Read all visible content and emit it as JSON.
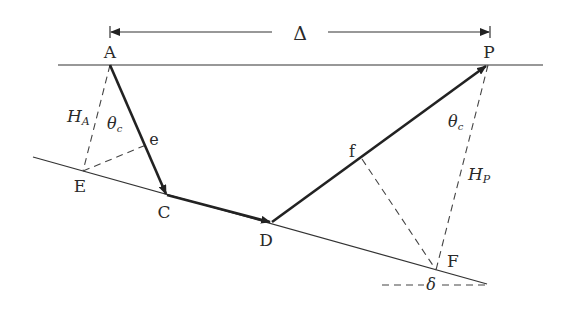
{
  "diagram": {
    "title_symbol": "Δ",
    "points": {
      "A": "A",
      "P": "P",
      "E": "E",
      "C": "C",
      "D": "D",
      "F": "F",
      "e": "e",
      "f": "f"
    },
    "labels": {
      "H_A_main": "H",
      "H_A_sub": "A",
      "H_P_main": "H",
      "H_P_sub": "P",
      "theta_left_main": "θ",
      "theta_left_sub": "c",
      "theta_right_main": "θ",
      "theta_right_sub": "c",
      "delta": "δ"
    },
    "colors": {
      "ink": "#222222",
      "thin": "#333333"
    }
  }
}
